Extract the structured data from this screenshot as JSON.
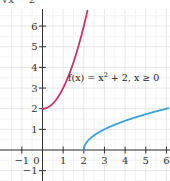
{
  "chart_data": {
    "type": "line",
    "title": "",
    "xlabel": "",
    "ylabel": "",
    "xlim": [
      -1.5,
      6.1
    ],
    "ylim": [
      -1.5,
      6.9
    ],
    "grid": true,
    "x_ticks": [
      -1,
      0,
      1,
      2,
      3,
      4,
      5,
      6
    ],
    "y_ticks": [
      -1,
      1,
      2,
      3,
      4,
      5,
      6
    ],
    "x_tick_labels": [
      "−1",
      "0",
      "1",
      "2",
      "3",
      "4",
      "5",
      "6"
    ],
    "y_tick_labels": [
      "−1",
      "1",
      "2",
      "3",
      "4",
      "5",
      "6"
    ],
    "series": [
      {
        "name": "f(x) = x² + 2, x ≥ 0",
        "color": "#c8336a",
        "x": [
          0,
          0.5,
          1,
          1.5,
          2,
          2.18
        ],
        "y": [
          2,
          2.25,
          3,
          4.25,
          6,
          6.75
        ]
      },
      {
        "name": "f⁻¹(x) = √(x − 2)",
        "color": "#3a9fd8",
        "x": [
          2,
          2.25,
          3,
          4,
          5,
          6
        ],
        "y": [
          0,
          0.5,
          1,
          1.414,
          1.732,
          2
        ]
      }
    ],
    "annotations": [
      {
        "text_parts": [
          "f(x) = x",
          "2",
          " + 2, x ≥ 0"
        ],
        "x": 1.2,
        "y": 3.6
      }
    ],
    "top_clipped_label": "√x − 2"
  },
  "labels": {
    "fn_main": "f(x) = x",
    "fn_sup": "2",
    "fn_rest": " + 2, x ≥ 0",
    "top_clipped": "√x − 2",
    "origin": "0"
  }
}
